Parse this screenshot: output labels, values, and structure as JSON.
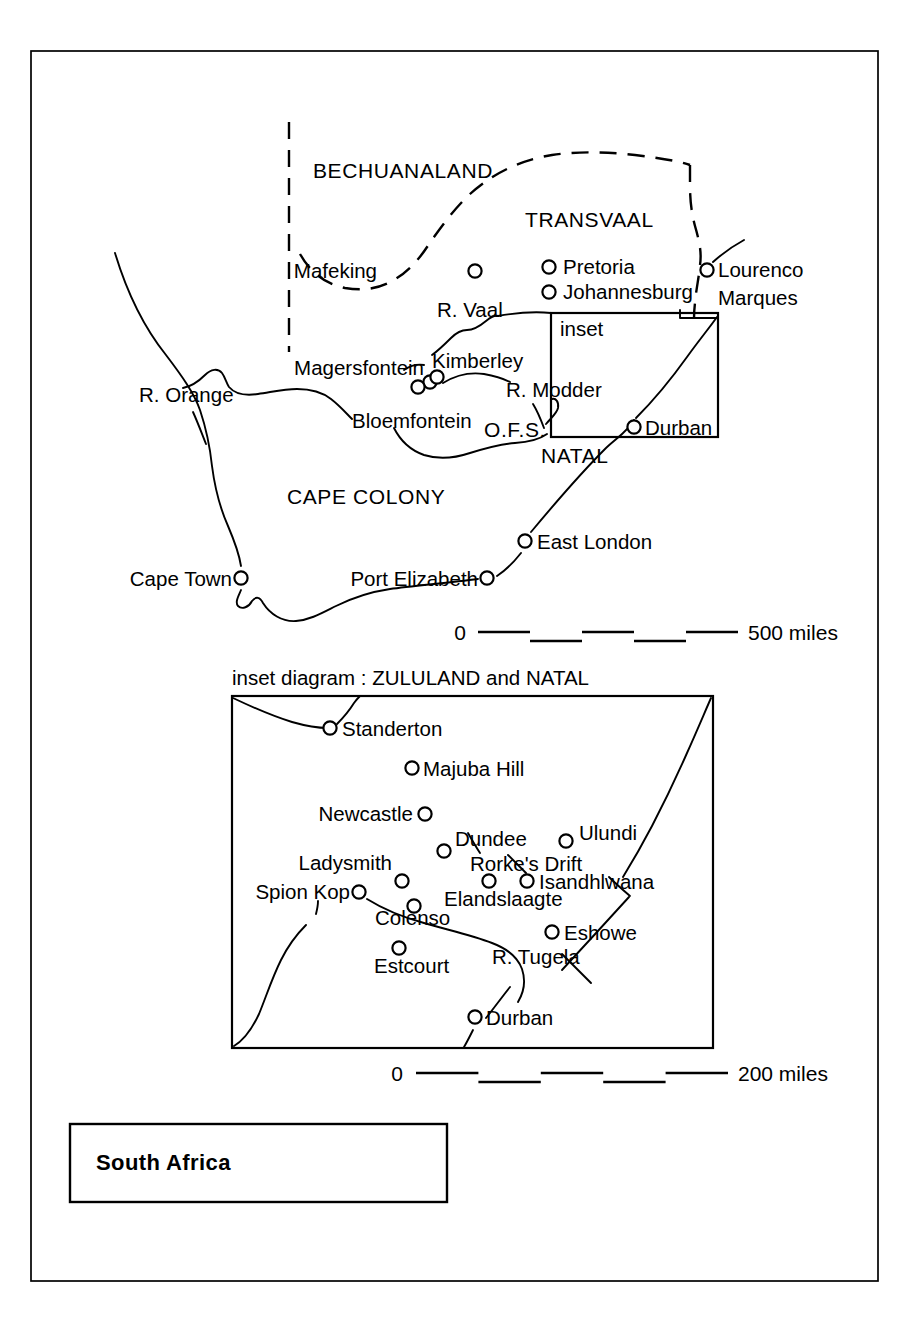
{
  "document": {
    "title_box_label": "South Africa",
    "frame": {
      "x": 31,
      "y": 51,
      "width": 847,
      "height": 1230
    }
  },
  "main_map": {
    "regions": [
      {
        "name": "BECHUANALAND",
        "x": 313,
        "y": 178
      },
      {
        "name": "TRANSVAAL",
        "x": 525,
        "y": 227
      },
      {
        "name": "CAPE COLONY",
        "x": 287,
        "y": 504
      },
      {
        "name": "NATAL",
        "x": 541,
        "y": 463
      },
      {
        "name": "O.F.S.",
        "x": 484,
        "y": 437
      }
    ],
    "cities": [
      {
        "name": "Mafeking",
        "cx": 475,
        "cy": 271,
        "label_x": 377,
        "label_y": 278,
        "anchor": "end"
      },
      {
        "name": "Pretoria",
        "cx": 549,
        "cy": 267,
        "label_x": 563,
        "label_y": 274,
        "anchor": "start"
      },
      {
        "name": "Johannesburg",
        "cx": 549,
        "cy": 292,
        "label_x": 563,
        "label_y": 299,
        "anchor": "start"
      },
      {
        "name": "Lourenco",
        "cx": 707,
        "cy": 270,
        "label_x": 718,
        "label_y": 277,
        "anchor": "start"
      },
      {
        "name": "Marques",
        "cx": null,
        "cy": null,
        "label_x": 718,
        "label_y": 305,
        "anchor": "start"
      },
      {
        "name": "Magersfontein",
        "cx": 430,
        "cy": 382,
        "label_x": 424,
        "label_y": 375,
        "anchor": "end"
      },
      {
        "name": "Kimberley",
        "cx": 437,
        "cy": 377,
        "label_x": 432,
        "label_y": 368,
        "anchor": "start"
      },
      {
        "name": "Bloemfontein",
        "cx": 418,
        "cy": 387,
        "label_x": 352,
        "label_y": 428,
        "anchor": "start"
      },
      {
        "name": "Durban",
        "cx": 634,
        "cy": 427,
        "label_x": 645,
        "label_y": 435,
        "anchor": "start"
      },
      {
        "name": "East London",
        "cx": 525,
        "cy": 541,
        "label_x": 537,
        "label_y": 549,
        "anchor": "start"
      },
      {
        "name": "Port Elizabeth",
        "cx": 487,
        "cy": 578,
        "label_x": 478,
        "label_y": 586,
        "anchor": "end"
      },
      {
        "name": "Cape Town",
        "cx": 241,
        "cy": 578,
        "label_x": 232,
        "label_y": 586,
        "anchor": "end"
      }
    ],
    "rivers": [
      {
        "name": "R. Orange",
        "label_x": 139,
        "label_y": 402
      },
      {
        "name": "R. Vaal",
        "label_x": 437,
        "label_y": 317
      },
      {
        "name": "R. Modder",
        "label_x": 506,
        "label_y": 397
      }
    ],
    "annotations": [
      {
        "name": "inset",
        "label_x": 560,
        "label_y": 336
      }
    ],
    "inset_rect": {
      "x": 551,
      "y": 313,
      "width": 167,
      "height": 124
    },
    "scale": {
      "zero_label": "0",
      "max_label": "500 miles",
      "zero_x": 460,
      "bar_start": 478,
      "bar_end": 738,
      "label_x": 748,
      "y": 632,
      "segments": 5
    }
  },
  "inset_map": {
    "caption": "inset diagram : ZULULAND and NATAL",
    "caption_x": 232,
    "caption_y": 685,
    "box": {
      "x": 232,
      "y": 696,
      "width": 481,
      "height": 352
    },
    "cities": [
      {
        "name": "Standerton",
        "cx": 330,
        "cy": 728,
        "label_x": 342,
        "label_y": 736,
        "anchor": "start"
      },
      {
        "name": "Majuba Hill",
        "cx": 412,
        "cy": 768,
        "label_x": 423,
        "label_y": 776,
        "anchor": "start"
      },
      {
        "name": "Newcastle",
        "cx": 425,
        "cy": 814,
        "label_x": 413,
        "label_y": 821,
        "anchor": "end"
      },
      {
        "name": "Dundee",
        "cx": 444,
        "cy": 851,
        "label_x": 455,
        "label_y": 846,
        "anchor": "start"
      },
      {
        "name": "Ulundi",
        "cx": 566,
        "cy": 841,
        "label_x": 579,
        "label_y": 840,
        "anchor": "start"
      },
      {
        "name": "Rorke's Drift",
        "cx": null,
        "cy": null,
        "label_x": 470,
        "label_y": 871,
        "anchor": "start"
      },
      {
        "name": "Isandhlwana",
        "cx": 527,
        "cy": 881,
        "label_x": 539,
        "label_y": 889,
        "anchor": "start"
      },
      {
        "name": "Ladysmith",
        "cx": 402,
        "cy": 881,
        "label_x": 392,
        "label_y": 870,
        "anchor": "end"
      },
      {
        "name": "Spion Kop",
        "cx": 359,
        "cy": 892,
        "label_x": 350,
        "label_y": 899,
        "anchor": "end"
      },
      {
        "name": "Elandslaagte",
        "cx": 489,
        "cy": 881,
        "label_x": 444,
        "label_y": 906,
        "anchor": "start"
      },
      {
        "name": "Colenso",
        "cx": 414,
        "cy": 906,
        "label_x": 375,
        "label_y": 925,
        "anchor": "start"
      },
      {
        "name": "Eshowe",
        "cx": 552,
        "cy": 932,
        "label_x": 564,
        "label_y": 940,
        "anchor": "start"
      },
      {
        "name": "Estcourt",
        "cx": 399,
        "cy": 948,
        "label_x": 374,
        "label_y": 973,
        "anchor": "start"
      },
      {
        "name": "Durban",
        "cx": 475,
        "cy": 1017,
        "label_x": 486,
        "label_y": 1025,
        "anchor": "start"
      }
    ],
    "rivers": [
      {
        "name": "R. Tugela",
        "label_x": 492,
        "label_y": 964
      }
    ],
    "scale": {
      "zero_label": "0",
      "max_label": "200 miles",
      "zero_x": 397,
      "bar_start": 416,
      "bar_end": 728,
      "label_x": 738,
      "y": 1073,
      "segments": 5
    }
  },
  "colors": {
    "ink": "#000000",
    "paper": "#ffffff"
  }
}
